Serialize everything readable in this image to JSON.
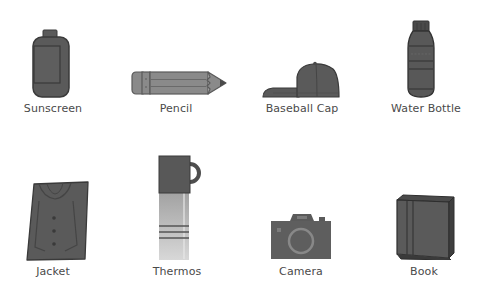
{
  "colors": {
    "icon_fill": "#5a5a5a",
    "icon_stroke": "#3a3a3a",
    "pencil_fill": "#8a8a8a",
    "thermos_body": "#b8b8b8",
    "label_text": "#4a4a4a",
    "background": "#ffffff"
  },
  "items": [
    {
      "label": "Sunscreen",
      "icon": "sunscreen-bottle-icon"
    },
    {
      "label": "Pencil",
      "icon": "pencil-icon"
    },
    {
      "label": "Baseball Cap",
      "icon": "baseball-cap-icon"
    },
    {
      "label": "Water Bottle",
      "icon": "water-bottle-icon"
    },
    {
      "label": "Jacket",
      "icon": "jacket-icon"
    },
    {
      "label": "Thermos",
      "icon": "thermos-icon"
    },
    {
      "label": "Camera",
      "icon": "camera-icon"
    },
    {
      "label": "Book",
      "icon": "book-icon"
    }
  ]
}
